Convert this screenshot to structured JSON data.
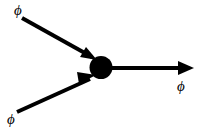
{
  "figure": {
    "type": "feynman-diagram",
    "background_color": "#ffffff",
    "stroke_color": "#000000",
    "width": 201,
    "height": 132,
    "vertex": {
      "name": "interaction-vertex",
      "shape": "filled-circle",
      "x": 101,
      "y": 67.5,
      "radius": 11,
      "fill": "#000000"
    },
    "lines": [
      {
        "id": "incoming-top",
        "label": "ϕ",
        "direction": "incoming",
        "x1": 22,
        "y1": 18,
        "x2": 95,
        "y2": 59,
        "arrow": "at-end",
        "stroke_width": 4
      },
      {
        "id": "incoming-bottom",
        "label": "ϕ",
        "direction": "incoming",
        "x1": 17,
        "y1": 112,
        "x2": 94,
        "y2": 77,
        "arrow": "at-end",
        "stroke_width": 4
      },
      {
        "id": "outgoing-right",
        "label": "ϕ",
        "direction": "outgoing",
        "x1": 108,
        "y1": 68,
        "x2": 194,
        "y2": 68,
        "arrow": "at-end",
        "stroke_width": 4
      }
    ],
    "labels": {
      "incoming_top": "ϕ",
      "incoming_bottom": "ϕ",
      "outgoing_right": "ϕ"
    }
  }
}
